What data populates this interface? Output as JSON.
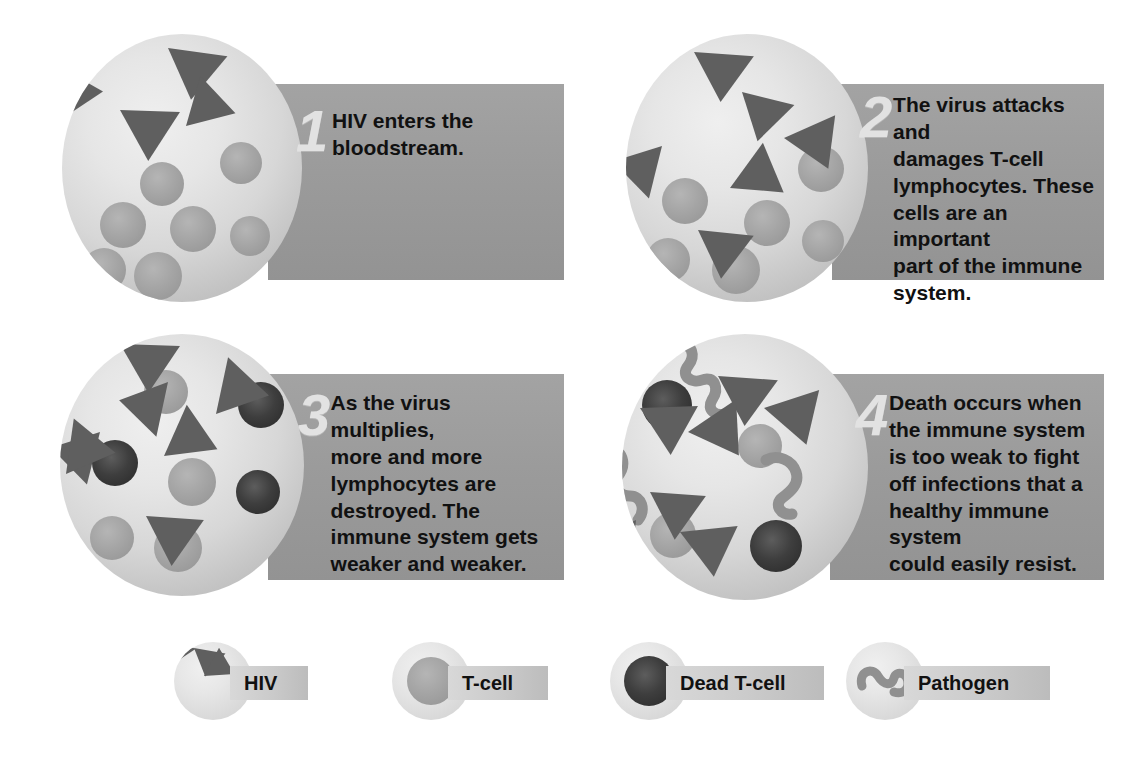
{
  "colors": {
    "banner_gray": "#9b9b9b",
    "hiv_triangle": "#5f5f5f",
    "tcell": "#a5a5a5",
    "dead_tcell": "#303030",
    "pathogen": "#8f8f8f",
    "circle_bg": "#e4e4e4",
    "step_number": "#e2e2e2",
    "text": "#111111",
    "page_bg": "#ffffff"
  },
  "steps": [
    {
      "number": "1",
      "text": "HIV enters the\nbloodstream.",
      "alt": "Circle of blood showing HIV particles and healthy T-cells"
    },
    {
      "number": "2",
      "text": "The virus attacks and\ndamages T-cell\nlymphocytes. These\ncells are an important\npart of the immune\nsystem.",
      "alt": "Circle of blood showing HIV particles attached to T-cells"
    },
    {
      "number": "3",
      "text": "As the virus multiplies,\nmore and more\nlymphocytes are\ndestroyed. The\nimmune system gets\nweaker and weaker.",
      "alt": "Circle of blood showing many HIV particles and dead T-cells"
    },
    {
      "number": "4",
      "text": "Death occurs when\nthe immune system\nis too weak to fight\noff infections that a\nhealthy immune system\ncould easily resist.",
      "alt": "Circle of blood showing HIV, dead T-cells and pathogens"
    }
  ],
  "legend": {
    "items": [
      {
        "icon": "hiv-icon",
        "label": "HIV"
      },
      {
        "icon": "tcell-icon",
        "label": "T-cell"
      },
      {
        "icon": "dead-tcell-icon",
        "label": "Dead T-cell"
      },
      {
        "icon": "pathogen-icon",
        "label": "Pathogen"
      }
    ]
  }
}
